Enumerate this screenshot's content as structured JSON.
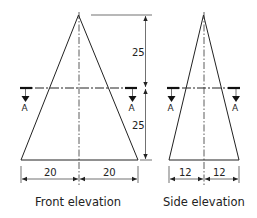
{
  "diagram": {
    "type": "orthographic-projection",
    "views": [
      {
        "name": "Front elevation",
        "label": "Front elevation",
        "dimensions": {
          "upper_height": "25",
          "lower_height": "25",
          "half_base_left": "20",
          "half_base_right": "20"
        }
      },
      {
        "name": "Side elevation",
        "label": "Side elevation",
        "dimensions": {
          "half_base_left": "12",
          "half_base_right": "12"
        }
      }
    ],
    "section": {
      "marker_label": "A",
      "description": "Section A-A cutting plane at mid-height"
    }
  },
  "labels": {
    "front": "Front elevation",
    "side": "Side elevation",
    "dim_25_top": "25",
    "dim_25_bottom": "25",
    "dim_20_left": "20",
    "dim_20_right": "20",
    "dim_12_left": "12",
    "dim_12_right": "12",
    "section_a": "A"
  }
}
